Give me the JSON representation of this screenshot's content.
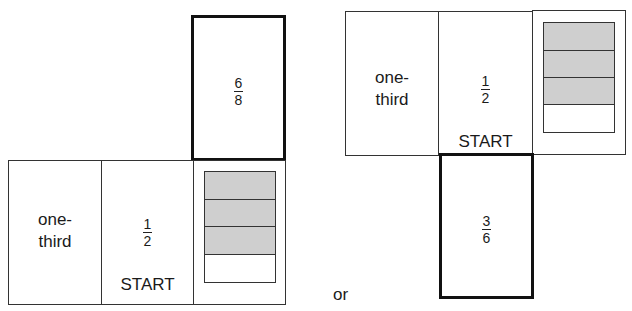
{
  "diagram": {
    "net_a": {
      "top_cell": {
        "numerator": "6",
        "denominator": "8",
        "bold": true
      },
      "row": [
        {
          "type": "text",
          "lines": [
            "one-",
            "third"
          ]
        },
        {
          "type": "fraction",
          "numerator": "1",
          "denominator": "2",
          "label": "START"
        },
        {
          "type": "shaded_bar",
          "parts": 4,
          "shaded": 3
        }
      ]
    },
    "connector": "or",
    "net_b": {
      "row": [
        {
          "type": "text",
          "lines": [
            "one-",
            "third"
          ]
        },
        {
          "type": "fraction",
          "numerator": "1",
          "denominator": "2",
          "label": "START"
        },
        {
          "type": "shaded_bar",
          "parts": 4,
          "shaded": 3
        }
      ],
      "bottom_cell": {
        "numerator": "3",
        "denominator": "6",
        "bold": true
      }
    },
    "colors": {
      "shade": "#cfcfcf",
      "border": "#333333",
      "bold_border": "#111111"
    }
  }
}
